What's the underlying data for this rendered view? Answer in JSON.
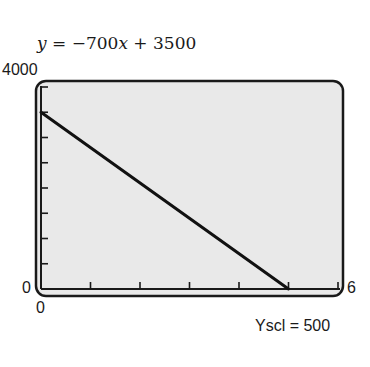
{
  "chart_data": {
    "type": "line",
    "title": "y = −700x + 3500",
    "equation": {
      "lhs": "y",
      "rhs_parts": [
        "−700",
        "x",
        " + 3500"
      ]
    },
    "xlabel": "",
    "ylabel": "",
    "xlim": [
      0,
      6
    ],
    "ylim": [
      0,
      4000
    ],
    "x_tick_step": 1,
    "y_tick_step": 500,
    "yscl_label": "Yscl = 500",
    "series": [
      {
        "name": "y = -700x + 3500",
        "x": [
          0,
          5
        ],
        "y": [
          3500,
          0
        ]
      }
    ],
    "axis_labels": {
      "ymax": "4000",
      "ymin": "0",
      "xmin": "0",
      "xmax": "6"
    },
    "grid": false,
    "legend": null
  },
  "colors": {
    "screen_bg": "#e9e9e9",
    "frame": "#1a1a1a",
    "line": "#111111"
  }
}
